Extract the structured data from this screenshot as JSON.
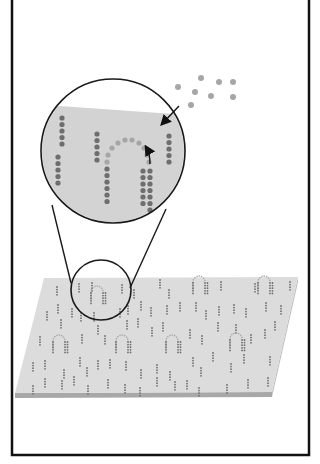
{
  "figure": {
    "colors": {
      "background": "#ffffff",
      "frame": "#111111",
      "plate_top": "#dcdcdc",
      "plate_edge": "#a8a8a8",
      "magnifier_fill": "#d3d3d3",
      "magnifier_stroke": "#1a1a1a",
      "dot_dark": "#6e6e6e",
      "dot_light": "#a6a6a6",
      "arrow": "#111111"
    },
    "magnifier": {
      "cx": 113,
      "cy": 151,
      "r": 72
    },
    "lens": {
      "cx": 101,
      "cy": 290,
      "r": 30
    },
    "free_particles": [
      [
        201,
        78
      ],
      [
        219,
        82
      ],
      [
        233,
        82
      ],
      [
        178,
        87
      ],
      [
        195,
        92
      ],
      [
        211,
        96
      ],
      [
        233,
        97
      ],
      [
        191,
        105
      ]
    ],
    "labels": []
  }
}
